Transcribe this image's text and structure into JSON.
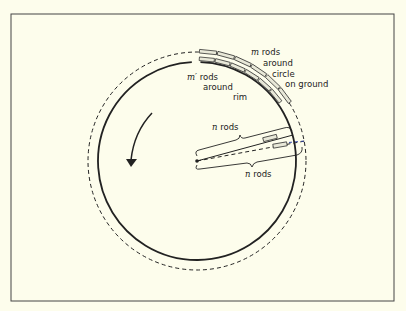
{
  "diagram": {
    "labels": {
      "m_rods": {
        "var": "m",
        "lines": [
          " rods",
          "around",
          "circle",
          "on ground"
        ]
      },
      "mprime_rods": {
        "var": "m′",
        "lines": [
          " rods",
          "around",
          "rim"
        ]
      },
      "n_rods_top": {
        "var": "n",
        "text": " rods"
      },
      "n_rods_bottom": {
        "var": "n",
        "text": " rods"
      }
    },
    "rotation_direction": "counterclockwise",
    "colors": {
      "ink": "#222222",
      "background": "#fdfdec",
      "rod_fill": "#e8e8d8",
      "dashed_radius": "#3344aa"
    },
    "rods_outer_count": 6,
    "rods_inner_count": 6
  }
}
